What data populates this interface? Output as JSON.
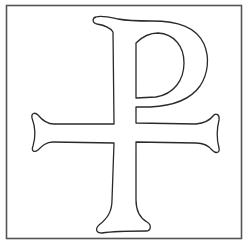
{
  "figure": {
    "title": "Chi-Rho style cross (Rho-cross / Staurogram) outline",
    "background_color": "#ffffff",
    "stroke_color": "#2a2a2a",
    "frame_color": "#555555"
  },
  "frame": {
    "x": 6,
    "y": 5,
    "width": 236,
    "height": 234
  },
  "glyph": {
    "symbol": "rho-cross-icon",
    "parts": [
      "serif-top",
      "stem",
      "bowl",
      "crossbar-left-arm",
      "crossbar-right-arm",
      "foot"
    ]
  }
}
